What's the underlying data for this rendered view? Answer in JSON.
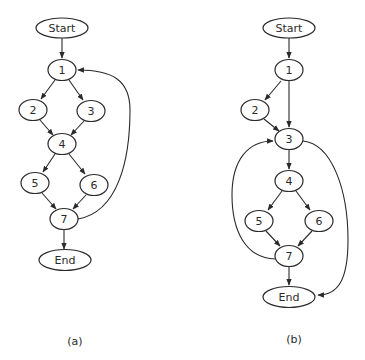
{
  "colors": {
    "stroke": "#2a2a2a",
    "fill": "#ffffff"
  },
  "graphs": [
    {
      "id": "a",
      "caption": "(a)",
      "nodes": [
        {
          "id": "start",
          "label": "Start"
        },
        {
          "id": "1",
          "label": "1"
        },
        {
          "id": "2",
          "label": "2"
        },
        {
          "id": "3",
          "label": "3"
        },
        {
          "id": "4",
          "label": "4"
        },
        {
          "id": "5",
          "label": "5"
        },
        {
          "id": "6",
          "label": "6"
        },
        {
          "id": "7",
          "label": "7"
        },
        {
          "id": "end",
          "label": "End"
        }
      ],
      "edges": [
        [
          "Start",
          "1"
        ],
        [
          "1",
          "2"
        ],
        [
          "1",
          "3"
        ],
        [
          "2",
          "4"
        ],
        [
          "3",
          "4"
        ],
        [
          "4",
          "5"
        ],
        [
          "4",
          "6"
        ],
        [
          "5",
          "7"
        ],
        [
          "6",
          "7"
        ],
        [
          "7",
          "End"
        ],
        [
          "7",
          "1"
        ]
      ]
    },
    {
      "id": "b",
      "caption": "(b)",
      "nodes": [
        {
          "id": "start",
          "label": "Start"
        },
        {
          "id": "1",
          "label": "1"
        },
        {
          "id": "2",
          "label": "2"
        },
        {
          "id": "3",
          "label": "3"
        },
        {
          "id": "4",
          "label": "4"
        },
        {
          "id": "5",
          "label": "5"
        },
        {
          "id": "6",
          "label": "6"
        },
        {
          "id": "7",
          "label": "7"
        },
        {
          "id": "end",
          "label": "End"
        }
      ],
      "edges": [
        [
          "Start",
          "1"
        ],
        [
          "1",
          "2"
        ],
        [
          "1",
          "3"
        ],
        [
          "2",
          "3"
        ],
        [
          "3",
          "4"
        ],
        [
          "4",
          "5"
        ],
        [
          "4",
          "6"
        ],
        [
          "5",
          "7"
        ],
        [
          "6",
          "7"
        ],
        [
          "7",
          "End"
        ],
        [
          "7",
          "3"
        ],
        [
          "3",
          "End"
        ]
      ]
    }
  ]
}
